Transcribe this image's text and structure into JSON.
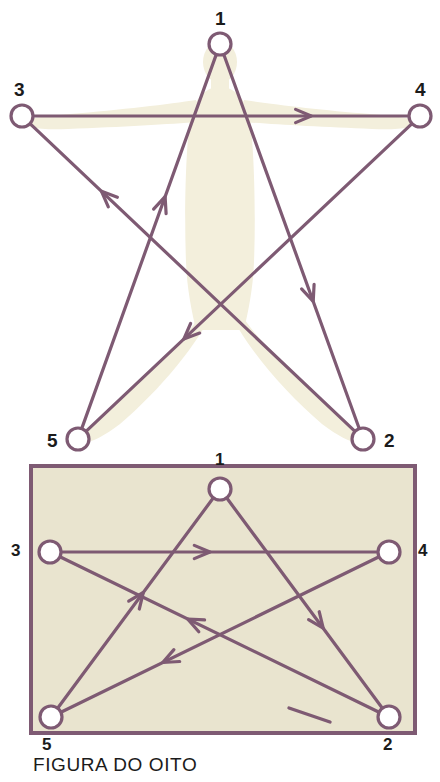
{
  "figure": {
    "caption": "FIGURA DO OITO",
    "title": "FIGURA DO OITO",
    "colors": {
      "stroke": "#7e5a73",
      "stroke_light": "#9c7b92",
      "silhouette": "#f3efdc",
      "panel_fill": "#e9e4cf",
      "panel_border": "#7e5a73",
      "node_fill": "#ffffff",
      "background": "#ffffff",
      "text": "#1b1b1b"
    },
    "panels": [
      {
        "id": "star-panel",
        "name": "pentagram-over-figure",
        "has_frame": false,
        "nodes": [
          {
            "id": "1",
            "label": "1",
            "x": 220,
            "y": 44,
            "r": 11,
            "label_x": 215,
            "label_y": 9
          },
          {
            "id": "2",
            "label": "2",
            "x": 363,
            "y": 439,
            "r": 11,
            "label_x": 384,
            "label_y": 431
          },
          {
            "id": "3",
            "label": "3",
            "x": 22,
            "y": 116,
            "r": 11,
            "label_x": 14,
            "label_y": 80
          },
          {
            "id": "4",
            "label": "4",
            "x": 420,
            "y": 116,
            "r": 11,
            "label_x": 415,
            "label_y": 80
          },
          {
            "id": "5",
            "label": "5",
            "x": 78,
            "y": 439,
            "r": 11,
            "label_x": 47,
            "label_y": 431
          }
        ],
        "edges": [
          {
            "from": "1",
            "to": "2",
            "arrow_t": 0.66,
            "name": "edge-1-to-2"
          },
          {
            "from": "2",
            "to": "3",
            "arrow_t": 0.78,
            "name": "edge-2-to-3"
          },
          {
            "from": "3",
            "to": "4",
            "arrow_t": 0.74,
            "name": "edge-3-to-4"
          },
          {
            "from": "4",
            "to": "5",
            "arrow_t": 0.7,
            "name": "edge-4-to-5"
          },
          {
            "from": "5",
            "to": "1",
            "arrow_t": 0.62,
            "name": "edge-5-to-1"
          }
        ]
      },
      {
        "id": "rect-panel",
        "name": "pentagram-in-rectangle",
        "has_frame": true,
        "frame": {
          "x": 31,
          "y": 16,
          "width": 384,
          "height": 267
        },
        "nodes": [
          {
            "id": "1",
            "label": "1",
            "x": 220,
            "y": 39,
            "r": 11,
            "label_x": 215,
            "label_y": 1
          },
          {
            "id": "2",
            "label": "2",
            "x": 389,
            "y": 267,
            "r": 11,
            "label_x": 383,
            "label_y": 286
          },
          {
            "id": "3",
            "label": "3",
            "x": 50,
            "y": 102,
            "r": 11,
            "label_x": 11,
            "label_y": 92
          },
          {
            "id": "4",
            "label": "4",
            "x": 389,
            "y": 102,
            "r": 11,
            "label_x": 418,
            "label_y": 92
          },
          {
            "id": "5",
            "label": "5",
            "x": 51,
            "y": 267,
            "r": 11,
            "label_x": 42,
            "label_y": 286
          }
        ],
        "edges": [
          {
            "from": "1",
            "to": "2",
            "arrow_t": 0.62,
            "name": "edge-1-to-2"
          },
          {
            "from": "2",
            "to": "3",
            "arrow_t": 0.6,
            "name": "edge-2-to-3"
          },
          {
            "from": "3",
            "to": "4",
            "arrow_t": 0.47,
            "name": "edge-3-to-4"
          },
          {
            "from": "4",
            "to": "5",
            "arrow_t": 0.68,
            "name": "edge-4-to-5"
          },
          {
            "from": "5",
            "to": "1",
            "arrow_t": 0.55,
            "name": "edge-5-to-1"
          }
        ]
      }
    ],
    "sequence": [
      "1",
      "2",
      "3",
      "4",
      "5",
      "1"
    ]
  },
  "chart_data": {
    "type": "diagram",
    "title": "FIGURA DO OITO",
    "nodes": [
      "1",
      "2",
      "3",
      "4",
      "5"
    ],
    "directed_edges": [
      {
        "from": "1",
        "to": "2"
      },
      {
        "from": "2",
        "to": "3"
      },
      {
        "from": "3",
        "to": "4"
      },
      {
        "from": "4",
        "to": "5"
      },
      {
        "from": "5",
        "to": "1"
      }
    ]
  }
}
